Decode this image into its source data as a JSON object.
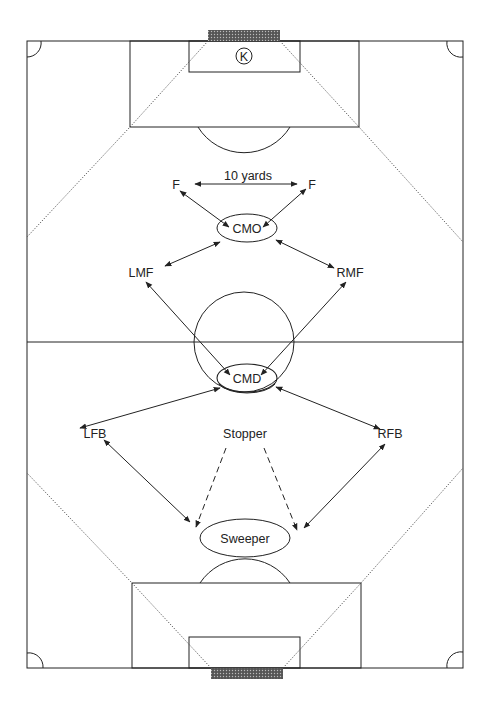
{
  "diagram": {
    "colors": {
      "line": "#222222",
      "net": "#333333",
      "background": "#ffffff"
    },
    "keeper": {
      "label": "K"
    },
    "distance_label": "10 yards",
    "positions": {
      "f_left": "F",
      "f_right": "F",
      "cmo": "CMO",
      "lmf": "LMF",
      "rmf": "RMF",
      "cmd": "CMD",
      "lfb": "LFB",
      "rfb": "RFB",
      "stopper": "Stopper",
      "sweeper": "Sweeper"
    }
  }
}
